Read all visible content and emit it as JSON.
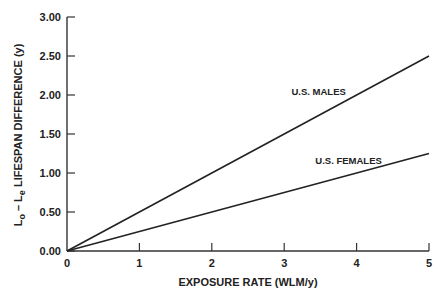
{
  "chart_data": {
    "type": "line",
    "title": "",
    "xlabel": "EXPOSURE RATE (WLM/y)",
    "ylabel": "L_o − L_e LIFESPAN DIFFERENCE (y)",
    "ylabel_parts": {
      "L1": "L",
      "sub1": "o",
      "dash": " – ",
      "L2": "L",
      "sub2": "e",
      "rest": " LIFESPAN DIFFERENCE (y)"
    },
    "xlim": [
      0,
      5
    ],
    "ylim": [
      0,
      3
    ],
    "x_ticks": [
      0,
      1,
      2,
      3,
      4,
      5
    ],
    "x_tick_labels": [
      "0",
      "1",
      "2",
      "3",
      "4",
      "5"
    ],
    "y_ticks": [
      0,
      0.5,
      1.0,
      1.5,
      2.0,
      2.5,
      3.0
    ],
    "y_tick_labels": [
      "0.00",
      "0.50",
      "1.00",
      "1.50",
      "2.00",
      "2.50",
      "3.00"
    ],
    "grid": false,
    "legend": "inline labels",
    "x": [
      0,
      5
    ],
    "series": [
      {
        "name": "U.S. MALES",
        "values": [
          0,
          2.5
        ],
        "label_pos": {
          "x": 3.1,
          "y": 2.0
        }
      },
      {
        "name": "U.S. FEMALES",
        "values": [
          0,
          1.25
        ],
        "label_pos": {
          "x": 3.43,
          "y": 1.12
        }
      }
    ],
    "colors": {
      "line": "#222222",
      "axis": "#333333",
      "background": "#ffffff"
    }
  }
}
